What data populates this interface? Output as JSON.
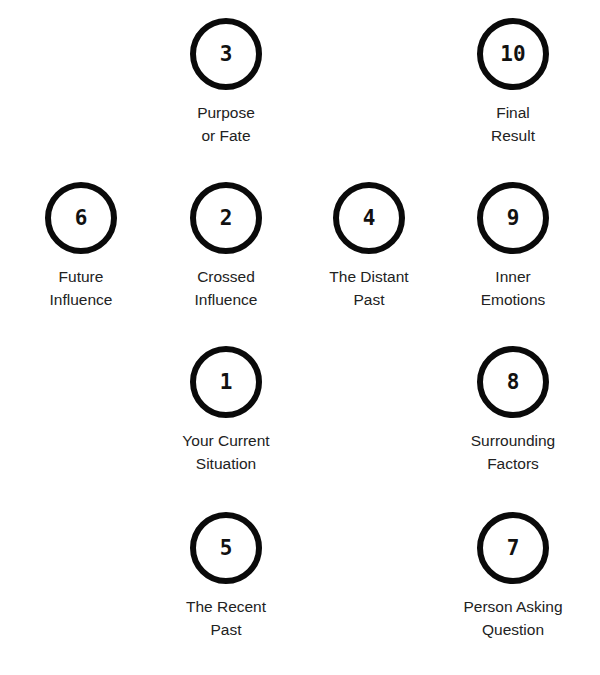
{
  "diagram": {
    "title": "",
    "positions": [
      {
        "number": "3",
        "line1": "Purpose",
        "line2": "or Fate",
        "cx": 226,
        "cy": 54
      },
      {
        "number": "10",
        "line1": "Final",
        "line2": "Result",
        "cx": 513,
        "cy": 54
      },
      {
        "number": "6",
        "line1": "Future",
        "line2": "Influence",
        "cx": 81,
        "cy": 218
      },
      {
        "number": "2",
        "line1": "Crossed",
        "line2": "Influence",
        "cx": 226,
        "cy": 218
      },
      {
        "number": "4",
        "line1": "The Distant",
        "line2": "Past",
        "cx": 369,
        "cy": 218
      },
      {
        "number": "9",
        "line1": "Inner",
        "line2": "Emotions",
        "cx": 513,
        "cy": 218
      },
      {
        "number": "1",
        "line1": "Your Current",
        "line2": "Situation",
        "cx": 226,
        "cy": 382
      },
      {
        "number": "8",
        "line1": "Surrounding",
        "line2": "Factors",
        "cx": 513,
        "cy": 382
      },
      {
        "number": "5",
        "line1": "The Recent",
        "line2": "Past",
        "cx": 226,
        "cy": 548
      },
      {
        "number": "7",
        "line1": "Person Asking",
        "line2": "Question",
        "cx": 513,
        "cy": 548
      }
    ]
  },
  "colors": {
    "circle_stroke": "#0a0a0a",
    "text": "#222222",
    "background": "#ffffff"
  }
}
